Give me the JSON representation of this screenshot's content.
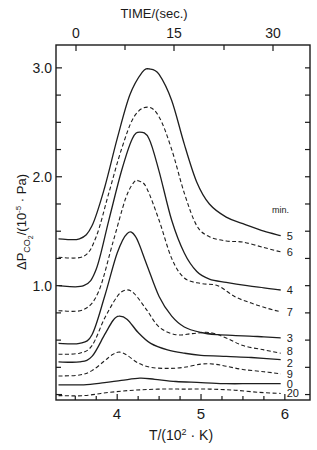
{
  "chart_data": {
    "type": "line",
    "title": "",
    "xlabel": "T/(10²·K)",
    "ylabel": "ΔP_CO2/(10⁻⁵·Pa)",
    "top_axis_label": "TIME/(sec.)",
    "top_axis_ticks": [
      "0",
      "15",
      "30"
    ],
    "x_ticks": [
      "4",
      "5",
      "6"
    ],
    "y_ticks": [
      "1.0",
      "2.0",
      "3.0"
    ],
    "xlim": [
      3.27,
      6.3
    ],
    "ylim": [
      -0.05,
      3.21
    ],
    "legend_title": "min.",
    "grid": false,
    "series": [
      {
        "name": "5",
        "style": "solid",
        "x": [
          3.3,
          3.55,
          3.7,
          3.85,
          4.0,
          4.15,
          4.3,
          4.39,
          4.5,
          4.65,
          4.8,
          4.95,
          5.1,
          5.3,
          5.5,
          5.75,
          5.95
        ],
        "y": [
          1.43,
          1.43,
          1.55,
          1.9,
          2.35,
          2.75,
          2.96,
          2.99,
          2.94,
          2.7,
          2.3,
          1.95,
          1.75,
          1.63,
          1.57,
          1.5,
          1.46
        ]
      },
      {
        "name": "6",
        "style": "dashed",
        "x": [
          3.3,
          3.6,
          3.75,
          3.9,
          4.05,
          4.2,
          4.36,
          4.5,
          4.65,
          4.8,
          4.95,
          5.1,
          5.3,
          5.5,
          5.75,
          5.95
        ],
        "y": [
          1.26,
          1.27,
          1.45,
          1.85,
          2.25,
          2.55,
          2.64,
          2.55,
          2.25,
          1.85,
          1.55,
          1.45,
          1.41,
          1.4,
          1.35,
          1.31
        ]
      },
      {
        "name": "4",
        "style": "solid",
        "x": [
          3.3,
          3.6,
          3.75,
          3.9,
          4.05,
          4.18,
          4.27,
          4.38,
          4.5,
          4.65,
          4.8,
          4.95,
          5.1,
          5.3,
          5.55,
          5.75,
          5.95
        ],
        "y": [
          1.0,
          1.0,
          1.15,
          1.6,
          2.05,
          2.35,
          2.41,
          2.35,
          2.05,
          1.6,
          1.3,
          1.13,
          1.06,
          1.03,
          1.0,
          0.98,
          0.96
        ]
      },
      {
        "name": "7",
        "style": "dashed",
        "x": [
          3.3,
          3.6,
          3.78,
          3.95,
          4.1,
          4.2,
          4.26,
          4.35,
          4.5,
          4.65,
          4.8,
          5.0,
          5.2,
          5.4,
          5.6,
          5.8,
          5.95
        ],
        "y": [
          0.77,
          0.78,
          0.95,
          1.4,
          1.8,
          1.95,
          1.96,
          1.9,
          1.6,
          1.25,
          1.07,
          1.02,
          1.0,
          0.9,
          0.84,
          0.79,
          0.76
        ]
      },
      {
        "name": "3",
        "style": "solid",
        "x": [
          3.3,
          3.55,
          3.7,
          3.85,
          4.0,
          4.12,
          4.22,
          4.35,
          4.5,
          4.65,
          4.8,
          5.0,
          5.2,
          5.5,
          5.75,
          5.95
        ],
        "y": [
          0.47,
          0.47,
          0.55,
          0.9,
          1.3,
          1.48,
          1.45,
          1.2,
          0.9,
          0.72,
          0.62,
          0.57,
          0.55,
          0.54,
          0.53,
          0.52
        ]
      },
      {
        "name": "8",
        "style": "dashed",
        "x": [
          3.3,
          3.55,
          3.7,
          3.85,
          4.0,
          4.1,
          4.2,
          4.35,
          4.5,
          4.7,
          4.9,
          5.1,
          5.3,
          5.5,
          5.75,
          5.95
        ],
        "y": [
          0.37,
          0.38,
          0.45,
          0.7,
          0.9,
          0.96,
          0.93,
          0.78,
          0.62,
          0.55,
          0.56,
          0.57,
          0.52,
          0.45,
          0.41,
          0.38
        ]
      },
      {
        "name": "2",
        "style": "solid",
        "x": [
          3.3,
          3.55,
          3.7,
          3.85,
          3.95,
          4.02,
          4.12,
          4.25,
          4.4,
          4.6,
          4.8,
          5.0,
          5.3,
          5.6,
          5.95
        ],
        "y": [
          0.3,
          0.3,
          0.35,
          0.55,
          0.68,
          0.72,
          0.69,
          0.57,
          0.47,
          0.41,
          0.38,
          0.36,
          0.35,
          0.34,
          0.32
        ]
      },
      {
        "name": "9",
        "style": "dashed",
        "x": [
          3.3,
          3.55,
          3.7,
          3.85,
          3.95,
          4.03,
          4.12,
          4.25,
          4.4,
          4.6,
          4.8,
          5.0,
          5.15,
          5.3,
          5.5,
          5.75,
          5.95
        ],
        "y": [
          0.17,
          0.18,
          0.22,
          0.31,
          0.37,
          0.39,
          0.36,
          0.29,
          0.25,
          0.24,
          0.25,
          0.28,
          0.28,
          0.26,
          0.23,
          0.21,
          0.19
        ]
      },
      {
        "name": "0",
        "style": "solid",
        "x": [
          3.3,
          3.6,
          3.85,
          4.05,
          4.27,
          4.45,
          4.7,
          5.0,
          5.3,
          5.6,
          5.95
        ],
        "y": [
          0.09,
          0.09,
          0.11,
          0.13,
          0.15,
          0.14,
          0.12,
          0.11,
          0.1,
          0.1,
          0.1
        ]
      },
      {
        "name": "20",
        "style": "dashed",
        "x": [
          3.3,
          3.6,
          3.9,
          4.2,
          4.5,
          4.8,
          5.1,
          5.4,
          5.7,
          5.95
        ],
        "y": [
          -0.01,
          -0.01,
          0.02,
          0.04,
          0.05,
          0.05,
          0.05,
          0.04,
          0.02,
          0.01
        ]
      }
    ]
  }
}
